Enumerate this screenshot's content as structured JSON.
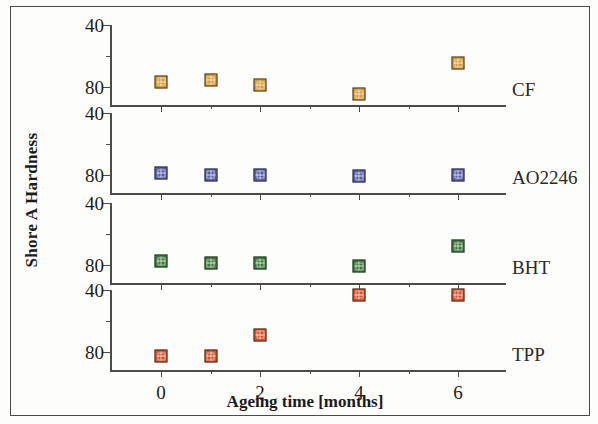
{
  "figure": {
    "y_axis_title": "Shore A Hardness",
    "x_axis_title": "Ageing time [months]"
  },
  "axes": {
    "ytick_labels": [
      "80",
      "40"
    ],
    "xtick_labels": [
      "0",
      "2",
      "4",
      "6"
    ]
  },
  "panels": [
    {
      "label": "CF",
      "color": "#d79b3c"
    },
    {
      "label": "AO2246",
      "color": "#5a5fa8"
    },
    {
      "label": "BHT",
      "color": "#3f7a3c"
    },
    {
      "label": "TPP",
      "color": "#d4552c"
    }
  ],
  "chart_data": {
    "type": "scatter",
    "title": "",
    "subtitle": "",
    "xlabel": "Ageing time [months]",
    "ylabel": "Shore A Hardness",
    "xlim": [
      -1,
      7
    ],
    "ylim": [
      28,
      84
    ],
    "xticks": [
      0,
      2,
      4,
      6
    ],
    "xticks_minor": [
      1,
      3,
      5
    ],
    "yticks": [
      40,
      80
    ],
    "yticks_minor": [
      60
    ],
    "grid": false,
    "legend_position": "panel-right",
    "layout": "4 stacked subpanels sharing x-axis",
    "x": [
      0,
      1,
      2,
      4,
      6
    ],
    "series": [
      {
        "name": "CF",
        "color": "#d79b3c",
        "panel": 1,
        "values": [
          43,
          44,
          41,
          35,
          55
        ]
      },
      {
        "name": "AO2246",
        "color": "#5a5fa8",
        "panel": 2,
        "values": [
          41,
          40,
          40,
          39,
          40
        ]
      },
      {
        "name": "BHT",
        "color": "#3f7a3c",
        "panel": 3,
        "values": [
          42,
          41,
          41,
          39,
          52
        ]
      },
      {
        "name": "TPP",
        "color": "#d4552c",
        "panel": 4,
        "values": [
          37,
          37,
          51,
          77,
          77
        ]
      }
    ]
  }
}
